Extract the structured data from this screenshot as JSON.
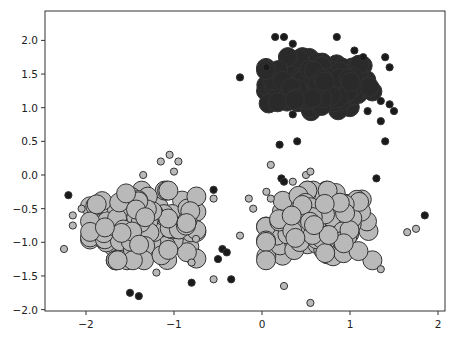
{
  "chart_data": {
    "type": "scatter",
    "title": "",
    "xlabel": "",
    "ylabel": "",
    "xlim": [
      -2.45,
      2.1
    ],
    "ylim": [
      -2.05,
      2.3
    ],
    "grid": false,
    "legend": null,
    "x_ticks": [
      -2,
      -1,
      0,
      1,
      2
    ],
    "x_tick_labels": [
      "−2",
      "−1",
      "0",
      "1",
      "2"
    ],
    "y_ticks": [
      -2.0,
      -1.5,
      -1.0,
      -0.5,
      0.0,
      0.5,
      1.0,
      1.5,
      2.0
    ],
    "y_tick_labels": [
      "−2.0",
      "−1.5",
      "−1.0",
      "−0.5",
      "0.0",
      "0.5",
      "1.0",
      "1.5",
      "2.0"
    ],
    "colors": {
      "cluster": "#2a2a2a",
      "core": "#b9b9b9",
      "noise": "#1a1a1a",
      "edge": "#333333"
    },
    "series": [
      {
        "name": "cluster-top-right (dark, large markers)",
        "center": [
          0.65,
          1.35
        ],
        "spread": [
          0.55,
          0.35
        ],
        "count": 150,
        "marker_size": "large",
        "color": "#2a2a2a"
      },
      {
        "name": "cluster-bottom-left (light gray, large markers)",
        "center": [
          -1.35,
          -0.75
        ],
        "spread": [
          0.55,
          0.45
        ],
        "count": 150,
        "marker_size": "large",
        "color": "#b9b9b9"
      },
      {
        "name": "cluster-bottom-right (light gray, large markers)",
        "center": [
          0.65,
          -0.75
        ],
        "spread": [
          0.55,
          0.45
        ],
        "count": 150,
        "marker_size": "large",
        "color": "#b9b9b9"
      },
      {
        "name": "noise (black, small markers)",
        "color": "#1a1a1a",
        "marker_size": "small",
        "points": [
          [
            -2.2,
            -0.3
          ],
          [
            -1.5,
            -1.75
          ],
          [
            -1.4,
            -1.8
          ],
          [
            -0.8,
            -1.6
          ],
          [
            -0.55,
            -0.22
          ],
          [
            -0.45,
            -1.1
          ],
          [
            -0.4,
            -1.15
          ],
          [
            -0.5,
            -1.25
          ],
          [
            -0.35,
            -1.55
          ],
          [
            0.2,
            0.45
          ],
          [
            0.22,
            -0.05
          ],
          [
            0.25,
            -0.1
          ],
          [
            1.3,
            -0.05
          ],
          [
            1.85,
            -0.6
          ],
          [
            -0.25,
            1.45
          ],
          [
            0.05,
            1.6
          ],
          [
            0.15,
            2.05
          ],
          [
            0.25,
            2.05
          ],
          [
            0.35,
            1.95
          ],
          [
            0.85,
            2.05
          ],
          [
            1.05,
            1.85
          ],
          [
            1.15,
            1.75
          ],
          [
            1.4,
            1.75
          ],
          [
            1.45,
            1.6
          ],
          [
            1.35,
            1.1
          ],
          [
            1.45,
            1.05
          ],
          [
            1.2,
            0.95
          ],
          [
            1.35,
            0.8
          ],
          [
            1.5,
            0.95
          ],
          [
            1.4,
            0.5
          ],
          [
            0.35,
            0.9
          ],
          [
            0.4,
            0.5
          ]
        ]
      },
      {
        "name": "core-outliers (light gray, small markers)",
        "color": "#b9b9b9",
        "marker_size": "small",
        "points": [
          [
            -2.25,
            -1.1
          ],
          [
            -2.15,
            -0.6
          ],
          [
            -2.05,
            -0.5
          ],
          [
            -2.15,
            -0.75
          ],
          [
            -1.35,
            0.0
          ],
          [
            -0.95,
            0.2
          ],
          [
            -1.0,
            0.05
          ],
          [
            -1.2,
            -1.45
          ],
          [
            -0.8,
            -1.3
          ],
          [
            -0.75,
            -0.95
          ],
          [
            -0.55,
            -0.35
          ],
          [
            -0.55,
            -1.55
          ],
          [
            -0.25,
            -0.9
          ],
          [
            -0.1,
            -0.5
          ],
          [
            -0.15,
            -0.35
          ],
          [
            0.1,
            0.15
          ],
          [
            0.05,
            -0.25
          ],
          [
            0.1,
            -0.35
          ],
          [
            0.35,
            -0.1
          ],
          [
            0.5,
            0.0
          ],
          [
            0.55,
            0.05
          ],
          [
            1.75,
            -0.8
          ],
          [
            1.65,
            -0.85
          ],
          [
            1.35,
            -1.4
          ],
          [
            0.55,
            -1.9
          ],
          [
            0.25,
            -1.65
          ],
          [
            -1.05,
            0.3
          ],
          [
            -1.15,
            0.2
          ]
        ]
      }
    ]
  }
}
